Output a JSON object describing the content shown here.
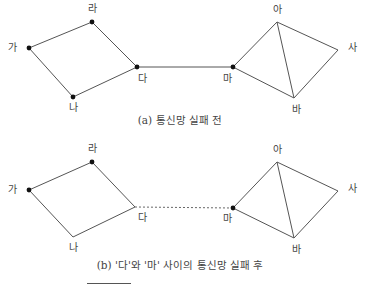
{
  "diagrams": [
    {
      "caption": "(a) 통신망 실패 전",
      "nodes": {
        "ga": {
          "label": "가",
          "x": 29,
          "y": 48,
          "dot": true,
          "lx": 12,
          "ly": 48
        },
        "ra": {
          "label": "라",
          "x": 92,
          "y": 22,
          "dot": true,
          "lx": 92,
          "ly": 9
        },
        "da": {
          "label": "다",
          "x": 137,
          "y": 67,
          "dot": true,
          "lx": 142,
          "ly": 79
        },
        "na": {
          "label": "나",
          "x": 73,
          "y": 97,
          "dot": true,
          "lx": 73,
          "ly": 108
        },
        "ma": {
          "label": "마",
          "x": 233,
          "y": 67,
          "dot": true,
          "lx": 227,
          "ly": 79
        },
        "a": {
          "label": "아",
          "x": 277,
          "y": 22,
          "dot": false,
          "lx": 277,
          "ly": 10
        },
        "sa": {
          "label": "사",
          "x": 338,
          "y": 50,
          "dot": false,
          "lx": 352,
          "ly": 48
        },
        "ba": {
          "label": "바",
          "x": 294,
          "y": 98,
          "dot": false,
          "lx": 296,
          "ly": 110
        }
      },
      "edges": [
        [
          "ga",
          "ra",
          "solid"
        ],
        [
          "ra",
          "da",
          "solid"
        ],
        [
          "da",
          "na",
          "solid"
        ],
        [
          "na",
          "ga",
          "solid"
        ],
        [
          "da",
          "ma",
          "solid"
        ],
        [
          "ma",
          "a",
          "solid"
        ],
        [
          "a",
          "sa",
          "solid"
        ],
        [
          "sa",
          "ba",
          "solid"
        ],
        [
          "ba",
          "ma",
          "solid"
        ],
        [
          "a",
          "ba",
          "solid"
        ]
      ]
    },
    {
      "caption": "(b) '다'와 '마' 사이의 통신망 실패 후",
      "nodes": {
        "ga": {
          "label": "가",
          "x": 29,
          "y": 190,
          "dot": true,
          "lx": 12,
          "ly": 190
        },
        "ra": {
          "label": "라",
          "x": 92,
          "y": 162,
          "dot": true,
          "lx": 92,
          "ly": 149
        },
        "da": {
          "label": "다",
          "x": 135,
          "y": 207,
          "dot": false,
          "lx": 142,
          "ly": 218
        },
        "na": {
          "label": "나",
          "x": 73,
          "y": 237,
          "dot": false,
          "lx": 73,
          "ly": 248
        },
        "ma": {
          "label": "마",
          "x": 233,
          "y": 208,
          "dot": true,
          "lx": 227,
          "ly": 219
        },
        "a": {
          "label": "아",
          "x": 277,
          "y": 162,
          "dot": false,
          "lx": 277,
          "ly": 150
        },
        "sa": {
          "label": "사",
          "x": 338,
          "y": 191,
          "dot": false,
          "lx": 352,
          "ly": 189
        },
        "ba": {
          "label": "바",
          "x": 294,
          "y": 238,
          "dot": false,
          "lx": 296,
          "ly": 250
        }
      },
      "edges": [
        [
          "ga",
          "ra",
          "solid"
        ],
        [
          "ra",
          "da",
          "solid"
        ],
        [
          "da",
          "na",
          "solid"
        ],
        [
          "na",
          "ga",
          "solid"
        ],
        [
          "da",
          "ma",
          "dashed"
        ],
        [
          "ma",
          "a",
          "solid"
        ],
        [
          "a",
          "sa",
          "solid"
        ],
        [
          "sa",
          "ba",
          "solid"
        ],
        [
          "ba",
          "ma",
          "solid"
        ],
        [
          "a",
          "ba",
          "solid"
        ]
      ]
    }
  ],
  "captions": {
    "a": "(a) 통신망 실패 전",
    "b": "(b) '다'와 '마' 사이의 통신망 실패 후"
  }
}
